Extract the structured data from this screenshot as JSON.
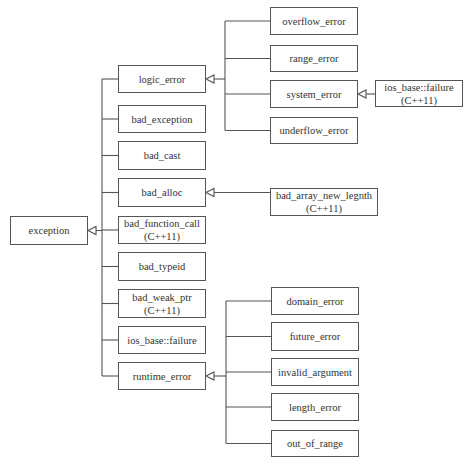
{
  "diagram": {
    "root": {
      "id": "exception",
      "label": "exception"
    },
    "nodes": [
      {
        "id": "exception",
        "lines": [
          "exception"
        ]
      },
      {
        "id": "logic_error",
        "lines": [
          "logic_error"
        ]
      },
      {
        "id": "bad_exception",
        "lines": [
          "bad_exception"
        ]
      },
      {
        "id": "bad_cast",
        "lines": [
          "bad_cast"
        ]
      },
      {
        "id": "bad_alloc",
        "lines": [
          "bad_alloc"
        ]
      },
      {
        "id": "bad_function_call",
        "lines": [
          "bad_function_call",
          "(C++11)"
        ]
      },
      {
        "id": "bad_typeid",
        "lines": [
          "bad_typeid"
        ]
      },
      {
        "id": "bad_weak_ptr",
        "lines": [
          "bad_weak_ptr",
          "(C++11)"
        ]
      },
      {
        "id": "ios_base_failure",
        "lines": [
          "ios_base::failure"
        ]
      },
      {
        "id": "runtime_error",
        "lines": [
          "runtime_error"
        ]
      },
      {
        "id": "overflow_error",
        "lines": [
          "overflow_error"
        ]
      },
      {
        "id": "range_error",
        "lines": [
          "range_error"
        ]
      },
      {
        "id": "system_error",
        "lines": [
          "system_error"
        ]
      },
      {
        "id": "underflow_error",
        "lines": [
          "underflow_error"
        ]
      },
      {
        "id": "ios_base_failure_cpp11",
        "lines": [
          "ios_base::failure",
          "(C++11)"
        ]
      },
      {
        "id": "bad_array_new_length",
        "lines": [
          "bad_array_new_legnth",
          "(C++11)"
        ]
      },
      {
        "id": "domain_error",
        "lines": [
          "domain_error"
        ]
      },
      {
        "id": "future_error",
        "lines": [
          "future_error"
        ]
      },
      {
        "id": "invalid_argument",
        "lines": [
          "invalid_argument"
        ]
      },
      {
        "id": "length_error",
        "lines": [
          "length_error"
        ]
      },
      {
        "id": "out_of_range",
        "lines": [
          "out_of_range"
        ]
      }
    ],
    "edges": [
      {
        "child": "logic_error",
        "parent": "exception"
      },
      {
        "child": "bad_exception",
        "parent": "exception"
      },
      {
        "child": "bad_cast",
        "parent": "exception"
      },
      {
        "child": "bad_alloc",
        "parent": "exception"
      },
      {
        "child": "bad_function_call",
        "parent": "exception"
      },
      {
        "child": "bad_typeid",
        "parent": "exception"
      },
      {
        "child": "bad_weak_ptr",
        "parent": "exception"
      },
      {
        "child": "ios_base_failure",
        "parent": "exception"
      },
      {
        "child": "runtime_error",
        "parent": "exception"
      },
      {
        "child": "overflow_error",
        "parent": "logic_error"
      },
      {
        "child": "range_error",
        "parent": "logic_error"
      },
      {
        "child": "system_error",
        "parent": "logic_error"
      },
      {
        "child": "underflow_error",
        "parent": "logic_error"
      },
      {
        "child": "ios_base_failure_cpp11",
        "parent": "system_error"
      },
      {
        "child": "bad_array_new_length",
        "parent": "bad_alloc"
      },
      {
        "child": "domain_error",
        "parent": "runtime_error"
      },
      {
        "child": "future_error",
        "parent": "runtime_error"
      },
      {
        "child": "invalid_argument",
        "parent": "runtime_error"
      },
      {
        "child": "length_error",
        "parent": "runtime_error"
      },
      {
        "child": "out_of_range",
        "parent": "runtime_error"
      }
    ],
    "colors": {
      "line": "#555555",
      "box_border": "#555555",
      "text": "#333333",
      "background": "#ffffff"
    }
  }
}
